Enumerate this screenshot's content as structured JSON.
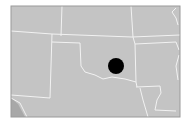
{
  "map": {
    "region": "South-central United States",
    "land_color": "#c4c4c4",
    "border_color": "#f2f2f2",
    "frame_color": "#9a9a9a",
    "water_color": "#a8a8a8",
    "marker": {
      "label": "Oklahoma location marker",
      "color": "#000000",
      "cx": 116,
      "cy": 66,
      "r": 8
    }
  }
}
